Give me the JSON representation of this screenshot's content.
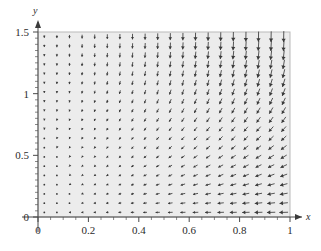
{
  "figure": {
    "kind": "direction-field",
    "background_color": "#ececec",
    "arrow_color": "#3a3a3a",
    "axis_color": "#4a4a4a"
  },
  "axes": {
    "x_label": "x",
    "y_label": "y",
    "x_ticklabels": [
      "0",
      "0.2",
      "0.4",
      "0.6",
      "0.8",
      "1"
    ],
    "x_tickvalues": [
      0,
      0.2,
      0.4,
      0.6,
      0.8,
      1
    ],
    "y_ticklabels": [
      "0",
      "0.5",
      "1",
      "1.5"
    ],
    "y_tickvalues": [
      0,
      0.5,
      1,
      1.5
    ],
    "x_minor_step": 0.05,
    "y_minor_step": 0.05,
    "xlim": [
      0,
      1
    ],
    "ylim": [
      0,
      1.5
    ]
  },
  "chart_data": {
    "type": "scatter",
    "title": "",
    "xlabel": "x",
    "ylabel": "y",
    "xlim": [
      0,
      1
    ],
    "ylim": [
      0,
      1.5
    ],
    "grid": false,
    "legend": "none",
    "field": {
      "description": "Direction field of arrows on a 20x20 grid over x in [0,1], y in [0,1.5]. Arrows point downward in the upper region and rotate toward the negative-x (leftward) direction near the bottom; magnitude grows with x and with y.",
      "nx": 20,
      "ny": 20,
      "x_start": 0.025,
      "x_step": 0.05,
      "y_start": 0.0375,
      "y_step": 0.075,
      "u_formula": "-x*(1.5-y)",
      "v_formula": "-y*(x+0.25)",
      "max_pixel_length": 11
    }
  }
}
